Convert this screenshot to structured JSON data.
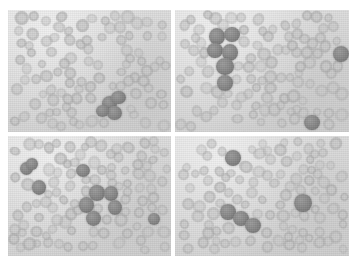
{
  "figure": {
    "panel_count": 4,
    "layout": "2x2",
    "modality": "light-microscopy-grayscale",
    "colors": {
      "page_background": "#ffffff",
      "panel_background": "#dadada",
      "gutter": "#ffffff",
      "rbc": "#c6c6c6",
      "dark_cell": "#8c8c8c"
    },
    "geometry": {
      "montage_left": 8,
      "montage_top": 10,
      "montage_width": 341,
      "montage_height": 246,
      "gutter_px": 4
    },
    "panels": [
      {
        "id": "panel-tl",
        "name": "top-left",
        "label": "",
        "rbc_count": 96,
        "dark_cell_count": 4,
        "note": "One compact cluster of dark cells in the lower right-of-center region.",
        "dark_cells": [
          {
            "x": 108,
            "y": 94,
            "r": 8.0
          },
          {
            "x": 118,
            "y": 88,
            "r": 7.5
          },
          {
            "x": 114,
            "y": 103,
            "r": 7.8
          },
          {
            "x": 101,
            "y": 101,
            "r": 6.8
          }
        ]
      },
      {
        "id": "panel-tr",
        "name": "top-right",
        "label": "",
        "rbc_count": 102,
        "dark_cell_count": 8,
        "note": "Vertical chain of six dark cells at upper left; isolated dark cells at right edge and lower right.",
        "dark_cells": [
          {
            "x": 42,
            "y": 26,
            "r": 8.2
          },
          {
            "x": 57,
            "y": 25,
            "r": 8.0
          },
          {
            "x": 40,
            "y": 41,
            "r": 7.4
          },
          {
            "x": 55,
            "y": 42,
            "r": 8.2
          },
          {
            "x": 50,
            "y": 57,
            "r": 8.4
          },
          {
            "x": 50,
            "y": 73,
            "r": 7.6
          },
          {
            "x": 166,
            "y": 44,
            "r": 8.0
          },
          {
            "x": 137,
            "y": 113,
            "r": 7.4
          }
        ]
      },
      {
        "id": "panel-bl",
        "name": "bottom-left",
        "label": "",
        "rbc_count": 100,
        "dark_cell_count": 10,
        "note": "Isolated dark cells along the left; a branching diagonal chain of dark cells through the centre-right.",
        "dark_cells": [
          {
            "x": 20,
            "y": 33,
            "r": 7.0
          },
          {
            "x": 26,
            "y": 28,
            "r": 6.2
          },
          {
            "x": 80,
            "y": 35,
            "r": 7.2
          },
          {
            "x": 33,
            "y": 52,
            "r": 7.6
          },
          {
            "x": 95,
            "y": 58,
            "r": 8.0
          },
          {
            "x": 110,
            "y": 58,
            "r": 7.8
          },
          {
            "x": 84,
            "y": 70,
            "r": 7.8
          },
          {
            "x": 114,
            "y": 72,
            "r": 7.6
          },
          {
            "x": 91,
            "y": 84,
            "r": 7.8
          },
          {
            "x": 156,
            "y": 84,
            "r": 6.4
          }
        ]
      },
      {
        "id": "panel-br",
        "name": "bottom-right",
        "label": "",
        "rbc_count": 104,
        "dark_cell_count": 5,
        "note": "One dark cell top-centre-left, a short chain of three dark cells lower left-of-centre, and an isolated dark cell at the right.",
        "dark_cells": [
          {
            "x": 58,
            "y": 23,
            "r": 8.0
          },
          {
            "x": 53,
            "y": 77,
            "r": 7.8
          },
          {
            "x": 66,
            "y": 84,
            "r": 7.8
          },
          {
            "x": 78,
            "y": 91,
            "r": 7.6
          },
          {
            "x": 128,
            "y": 68,
            "r": 8.4
          }
        ]
      }
    ]
  }
}
